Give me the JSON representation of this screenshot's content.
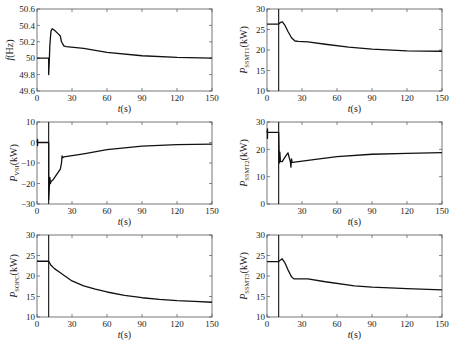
{
  "chart_data": [
    {
      "type": "line",
      "id": "freq",
      "ylabel": "f(Hz)",
      "ylabel_main": "f",
      "ylabel_sub": "",
      "ylabel_unit": "(Hz)",
      "xlabel": "t(s)",
      "xlim": [
        0,
        150
      ],
      "ylim": [
        49.6,
        50.6
      ],
      "xticks": [
        0,
        30,
        60,
        90,
        120,
        150
      ],
      "yticks": [
        49.6,
        49.8,
        50,
        50.2,
        50.4,
        50.6
      ],
      "ytick_labels": [
        "49.6",
        "49.8",
        "50",
        "50.2",
        "50.4",
        "50.6"
      ],
      "vline_x": null,
      "series": [
        {
          "name": "f",
          "x": [
            0,
            10,
            10,
            10.5,
            11,
            11.5,
            12,
            13,
            15,
            18,
            20,
            21,
            23,
            25,
            40,
            60,
            90,
            120,
            150
          ],
          "y": [
            50,
            50,
            49.8,
            49.95,
            50.15,
            50.25,
            50.33,
            50.36,
            50.34,
            50.3,
            50.27,
            50.2,
            50.15,
            50.14,
            50.12,
            50.07,
            50.03,
            50.01,
            50.0
          ]
        }
      ]
    },
    {
      "type": "line",
      "id": "pssmt1",
      "ylabel": "P_SSMT1(kW)",
      "ylabel_main": "P",
      "ylabel_sub": "SSMT1",
      "ylabel_unit": "(kW)",
      "xlabel": "t(s)",
      "xlim": [
        0,
        150
      ],
      "ylim": [
        10,
        30
      ],
      "xticks": [
        0,
        30,
        60,
        90,
        120,
        150
      ],
      "yticks": [
        10,
        15,
        20,
        25,
        30
      ],
      "ytick_labels": [
        "10",
        "15",
        "20",
        "25",
        "30"
      ],
      "vline_x": 10,
      "series": [
        {
          "name": "P_SSMT1",
          "x": [
            0,
            10,
            11,
            13,
            15,
            18,
            21,
            24,
            27,
            35,
            50,
            70,
            90,
            120,
            150
          ],
          "y": [
            26.3,
            26.3,
            26.6,
            26.9,
            26.2,
            24.5,
            23,
            22.2,
            22.1,
            22.0,
            21.4,
            20.7,
            20.2,
            19.8,
            19.7
          ]
        }
      ]
    },
    {
      "type": "line",
      "id": "pvsi",
      "ylabel": "P_VSI(kW)",
      "ylabel_main": "P",
      "ylabel_sub": "VSI",
      "ylabel_unit": "(kW)",
      "xlabel": "t(s)",
      "xlim": [
        0,
        150
      ],
      "ylim": [
        -30,
        10
      ],
      "xticks": [
        0,
        30,
        60,
        90,
        120,
        150
      ],
      "yticks": [
        -30,
        -20,
        -10,
        0,
        10
      ],
      "ytick_labels": [
        "−30",
        "−20",
        "−10",
        "0",
        "10"
      ],
      "vline_x": 10,
      "series": [
        {
          "name": "P_VSI",
          "x": [
            0,
            0.5,
            0.5,
            0.5,
            10,
            10,
            11,
            11.5,
            12,
            14,
            20,
            21,
            21.5,
            22,
            23,
            40,
            60,
            90,
            120,
            150
          ],
          "y": [
            0,
            1.5,
            -1.5,
            0,
            0,
            -28,
            -17,
            -20,
            -19,
            -18,
            -13,
            -10,
            -6.5,
            -7.5,
            -7,
            -5.5,
            -3.5,
            -1.8,
            -1.0,
            -0.8
          ]
        }
      ]
    },
    {
      "type": "line",
      "id": "pssmt2",
      "ylabel": "P_SSMT2(kW)",
      "ylabel_main": "P",
      "ylabel_sub": "SSMT2",
      "ylabel_unit": "(kW)",
      "xlabel": "t(s)",
      "xlim": [
        0,
        150
      ],
      "ylim": [
        0,
        30
      ],
      "xticks": [
        30,
        60,
        90,
        120,
        150
      ],
      "yticks": [
        0,
        10,
        20,
        30
      ],
      "ytick_labels": [
        "0",
        "10",
        "20",
        "30"
      ],
      "vline_x": 10,
      "series": [
        {
          "name": "P_SSMT2",
          "x": [
            0,
            0.4,
            0.4,
            0.5,
            10,
            10.5,
            11,
            11.5,
            13,
            16,
            18,
            19,
            20,
            20.5,
            21,
            21.5,
            22,
            40,
            60,
            90,
            120,
            150
          ],
          "y": [
            26,
            27.5,
            24,
            26.2,
            26.2,
            15,
            19,
            15.5,
            15.5,
            17.5,
            18.7,
            17,
            15.5,
            13.5,
            16.5,
            15.2,
            15.2,
            16.2,
            17.3,
            18.2,
            18.5,
            18.8
          ]
        }
      ]
    },
    {
      "type": "line",
      "id": "psofc",
      "ylabel": "P_SOFC(kW)",
      "ylabel_main": "P",
      "ylabel_sub": "SOFC",
      "ylabel_unit": "(kW)",
      "xlabel": "t(s)",
      "xlim": [
        0,
        150
      ],
      "ylim": [
        10,
        30
      ],
      "xticks": [
        0,
        30,
        60,
        90,
        120,
        150
      ],
      "yticks": [
        10,
        15,
        20,
        25,
        30
      ],
      "ytick_labels": [
        "10",
        "15",
        "20",
        "25",
        "30"
      ],
      "vline_x": 10,
      "series": [
        {
          "name": "P_SOFC",
          "x": [
            0,
            10,
            11,
            12,
            15,
            20,
            30,
            40,
            50,
            60,
            75,
            90,
            105,
            120,
            135,
            150
          ],
          "y": [
            23.6,
            23.6,
            23.1,
            22.6,
            21.8,
            20.8,
            18.8,
            17.6,
            16.8,
            16.1,
            15.3,
            14.7,
            14.3,
            14.0,
            13.8,
            13.6
          ]
        }
      ]
    },
    {
      "type": "line",
      "id": "pssmt3",
      "ylabel": "P_SSMT3(kW)",
      "ylabel_main": "P",
      "ylabel_sub": "SSMT3",
      "ylabel_unit": "(kW)",
      "xlabel": "t(s)",
      "xlim": [
        0,
        150
      ],
      "ylim": [
        10,
        30
      ],
      "xticks": [
        0,
        30,
        60,
        90,
        120,
        150
      ],
      "yticks": [
        10,
        15,
        20,
        25,
        30
      ],
      "ytick_labels": [
        "10",
        "15",
        "20",
        "25",
        "30"
      ],
      "vline_x": 10,
      "series": [
        {
          "name": "P_SSMT3",
          "x": [
            0,
            10,
            11,
            13,
            15,
            18,
            21,
            23,
            26,
            35,
            50,
            75,
            90,
            120,
            150
          ],
          "y": [
            23.5,
            23.5,
            23.8,
            24.2,
            23.4,
            21.5,
            19.8,
            19.3,
            19.3,
            19.3,
            18.6,
            17.6,
            17.3,
            16.9,
            16.6
          ]
        }
      ]
    }
  ],
  "layout": {
    "panels": [
      {
        "left": 37,
        "top": 9,
        "right": 212,
        "bottom": 91
      },
      {
        "left": 267,
        "top": 9,
        "right": 442,
        "bottom": 91
      },
      {
        "left": 37,
        "top": 122,
        "right": 212,
        "bottom": 204
      },
      {
        "left": 267,
        "top": 122,
        "right": 442,
        "bottom": 204
      },
      {
        "left": 37,
        "top": 235,
        "right": 212,
        "bottom": 317
      },
      {
        "left": 267,
        "top": 235,
        "right": 442,
        "bottom": 317
      }
    ]
  }
}
